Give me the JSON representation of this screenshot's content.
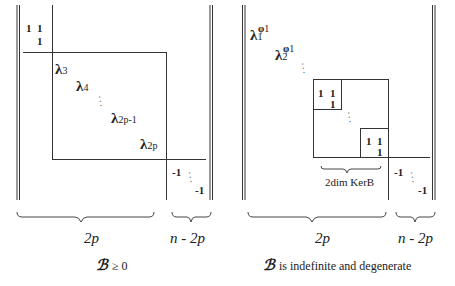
{
  "left_panel": {
    "block_top_left": {
      "r1c1": "1",
      "r1c2": "1",
      "r2c2": "1"
    },
    "eigenvalues": [
      {
        "symbol": "λ",
        "sub": "3"
      },
      {
        "symbol": "λ",
        "sub": "4"
      },
      {
        "symbol": "λ",
        "sub": "2p-1"
      },
      {
        "symbol": "λ",
        "sub": "2p"
      }
    ],
    "ellipsis": "⋱",
    "neg_block": {
      "first": "-1",
      "last": "-1"
    },
    "brace_labels": {
      "left": "2p",
      "right": "n - 2p"
    },
    "caption": {
      "symbol": "ℬ",
      "text": "≥ 0"
    }
  },
  "right_panel": {
    "eigenvalues": [
      {
        "symbol": "λ",
        "sub": "1",
        "sup": "φ",
        "sup_sub": "1"
      },
      {
        "symbol": "λ",
        "sub": "2",
        "sup": "φ",
        "sup_sub": "1"
      }
    ],
    "ellipsis": "⋱",
    "kernel_block_1": {
      "r1c1": "1",
      "r1c2": "1",
      "r2c2": "1"
    },
    "kernel_block_2": {
      "r1c1": "1",
      "r1c2": "1",
      "r2c2": "1"
    },
    "kernel_label": "2dim KerB",
    "neg_block": {
      "first": "-1",
      "last": "-1"
    },
    "brace_labels": {
      "left": "2p",
      "right": "n - 2p"
    },
    "caption": {
      "symbol": "ℬ",
      "text": "is indefinite and degenerate"
    }
  }
}
